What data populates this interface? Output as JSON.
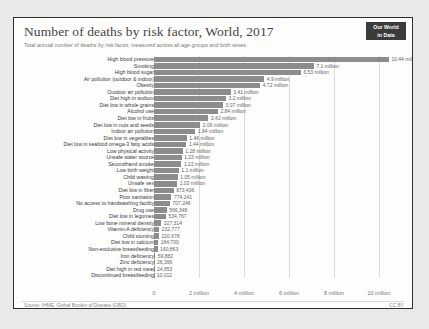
{
  "header": {
    "title": "Number of deaths by risk factor, World, 2017",
    "subtitle": "Total annual number of deaths by risk factor, measured across all age groups and both sexes.",
    "logo_line1": "Our World",
    "logo_line2": "in Data"
  },
  "footer": {
    "source": "Source: IHME, Global Burden of Disease (GBD)",
    "license": "CC BY"
  },
  "colors": {
    "bar": "#8c8c8c",
    "grid": "#dcdcda",
    "label": "#3a3a3a",
    "value": "#666666",
    "logo_bg": "#3b3b3b",
    "frame_border": "#2e2e2e",
    "page_bg": "#e9e9e7",
    "panel_bg": "#fdfdfc"
  },
  "chart_data": {
    "type": "bar",
    "orientation": "horizontal",
    "title": "Number of deaths by risk factor, World, 2017",
    "subtitle": "Total annual number of deaths by risk factor, measured across all age groups and both sexes.",
    "xlabel": "",
    "ylabel": "",
    "xlim": [
      0,
      11200000
    ],
    "grid": true,
    "legend": "none",
    "tick_labels": [
      "0",
      "2 million",
      "4 million",
      "6 million",
      "8 million",
      "10 million"
    ],
    "tick_values": [
      0,
      2000000,
      4000000,
      6000000,
      8000000,
      10000000
    ],
    "categories": [
      "High blood pressure",
      "Smoking",
      "High blood sugar",
      "Air pollution (outdoor & indoor)",
      "Obesity",
      "Outdoor air pollution",
      "Diet high in sodium",
      "Diet low in whole grains",
      "Alcohol use",
      "Diet low in fruits",
      "Diet low in nuts and seeds",
      "Indoor air pollution",
      "Diet low in vegetables",
      "Diet low in seafood omega-3 fatty acids",
      "Low physical activity",
      "Unsafe water source",
      "Secondhand smoke",
      "Low birth weight",
      "Child wasting",
      "Unsafe sex",
      "Diet low in fiber",
      "Poor sanitation",
      "No access to handwashing facility",
      "Drug use",
      "Diet low in legumes",
      "Low bone mineral density",
      "Vitamin-A deficiency",
      "Child stunting",
      "Diet low in calcium",
      "Non-exclusive breastfeeding",
      "Iron deficiency",
      "Zinc deficiency",
      "Diet high in red meat",
      "Discontinued breastfeeding"
    ],
    "values": [
      10440000,
      7100000,
      6530000,
      4900000,
      4720000,
      3410000,
      3200000,
      3070000,
      2840000,
      2420000,
      2060000,
      1840000,
      1460000,
      1440000,
      1280000,
      1230000,
      1220000,
      1100000,
      1050000,
      1030000,
      873406,
      774241,
      707246,
      566348,
      534767,
      327314,
      232777,
      220678,
      184700,
      160863,
      59882,
      26396,
      24853,
      10012
    ],
    "value_labels": [
      "10.44 million",
      "7.1 million",
      "6.53 million",
      "4.9 million",
      "4.72 million",
      "3.41 million",
      "3.2 million",
      "3.07 million",
      "2.84 million",
      "2.42 million",
      "2.06 million",
      "1.84 million",
      "1.46 million",
      "1.44 million",
      "1.28 million",
      "1.23 million",
      "1.22 million",
      "1.1 million",
      "1.05 million",
      "1.03 million",
      "873,406",
      "774,241",
      "707,246",
      "566,348",
      "534,767",
      "327,314",
      "232,777",
      "220,678",
      "184,700",
      "160,863",
      "59,882",
      "26,396",
      "24,853",
      "10,012"
    ]
  }
}
